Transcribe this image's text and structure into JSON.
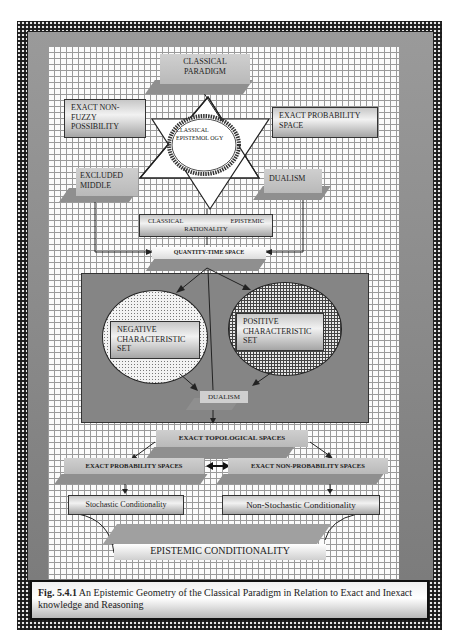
{
  "diagram": {
    "nodes": {
      "classical_paradigm": "CLASSICAL PARADIGM",
      "exact_non_fuzzy_possibility": "EXACT NON-FUZZY POSSIBILITY",
      "exact_probability_space": "EXACT PROBABILITY SPACE",
      "classical_epistemology": "CLASSICAL EPISTEMOL OGY",
      "excluded_middle": "EXCLUDED MIDDLE",
      "dualism_top": "DUALISM",
      "classical_epistemic_rationality_l": "CLASSICAL",
      "classical_epistemic_rationality_r": "EPISTEMIC",
      "classical_epistemic_rationality_b": "RATIONALITY",
      "quantity_time_space": "QUANTITY-TIME SPACE",
      "negative_characteristic_set": "NEGATIVE CHARACTERISTIC SET",
      "positive_characteristic_set": "POSITIVE CHARACTERISTIC SET",
      "dualism_bottom": "DUALISM",
      "exact_topological_spaces": "EXACT TOPOLOGICAL SPACES",
      "exact_probability_spaces": "EXACT PROBABILITY SPACES",
      "exact_non_probability_spaces": "EXACT NON-PROBABILITY SPACES",
      "stochastic_conditionality": "Stochastic Conditionality",
      "non_stochastic_conditionality": "Non-Stochastic Conditionality",
      "epistemic_conditionality": "EPISTEMIC CONDITIONALITY"
    },
    "caption": {
      "label": "Fig. 5.4.1",
      "text": " An Epistemic Geometry of the Classical Paradigm in Relation to Exact and Inexact knowledge and Reasoning"
    }
  }
}
